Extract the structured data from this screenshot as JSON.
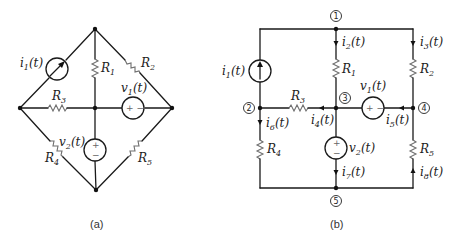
{
  "figure_a": {
    "caption": "(a)",
    "labels": {
      "i1": "i",
      "i1_sub": "1",
      "i1_t": "(t)",
      "R1": "R",
      "R1_sub": "1",
      "R2": "R",
      "R2_sub": "2",
      "R3": "R",
      "R3_sub": "3",
      "R4": "R",
      "R4_sub": "4",
      "R5": "R",
      "R5_sub": "5",
      "v1": "v",
      "v1_sub": "1",
      "v1_t": "(t)",
      "v2": "v",
      "v2_sub": "2",
      "v2_t": "(t)"
    },
    "source_signs": {
      "v1": "+ −",
      "v2_plus": "+",
      "v2_minus": "−"
    }
  },
  "figure_b": {
    "caption": "(b)",
    "nodes": [
      "1",
      "2",
      "3",
      "4",
      "5"
    ],
    "labels": {
      "i1": "i",
      "i1_sub": "1",
      "i1_t": "(t)",
      "i2": "i",
      "i2_sub": "2",
      "i2_t": "(t)",
      "i3": "i",
      "i3_sub": "3",
      "i3_t": "(t)",
      "i4": "i",
      "i4_sub": "4",
      "i4_t": "(t)",
      "i5": "i",
      "i5_sub": "5",
      "i5_t": "(t)",
      "i6": "i",
      "i6_sub": "6",
      "i6_t": "(t)",
      "i7": "i",
      "i7_sub": "7",
      "i7_t": "(t)",
      "i8": "i",
      "i8_sub": "8",
      "i8_t": "(t)",
      "R1": "R",
      "R1_sub": "1",
      "R2": "R",
      "R2_sub": "2",
      "R3": "R",
      "R3_sub": "3",
      "R4": "R",
      "R4_sub": "4",
      "R5": "R",
      "R5_sub": "5",
      "v1": "v",
      "v1_sub": "1",
      "v1_t": "(t)",
      "v2": "v",
      "v2_sub": "2",
      "v2_t": "(t)"
    },
    "source_signs": {
      "v1": "+ −",
      "v2_plus": "+",
      "v2_minus": "−"
    }
  }
}
